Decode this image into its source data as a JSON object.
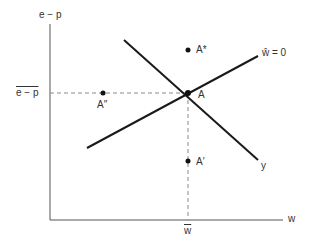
{
  "axes": {
    "y_label": "e − p",
    "x_label": "w"
  },
  "ticks": {
    "y_tick": "e − p",
    "y_tick_overline": true,
    "x_tick": "w",
    "x_tick_overline": true
  },
  "lines": {
    "upward": {
      "label": "ŵ = 0"
    },
    "downward": {
      "label": "y"
    }
  },
  "points": {
    "A": "A",
    "A_star": "A*",
    "A_double_prime": "A″",
    "A_prime": "A′"
  },
  "colors": {
    "line": "#1a1a1a",
    "axis": "#555555",
    "dash": "#888888"
  }
}
